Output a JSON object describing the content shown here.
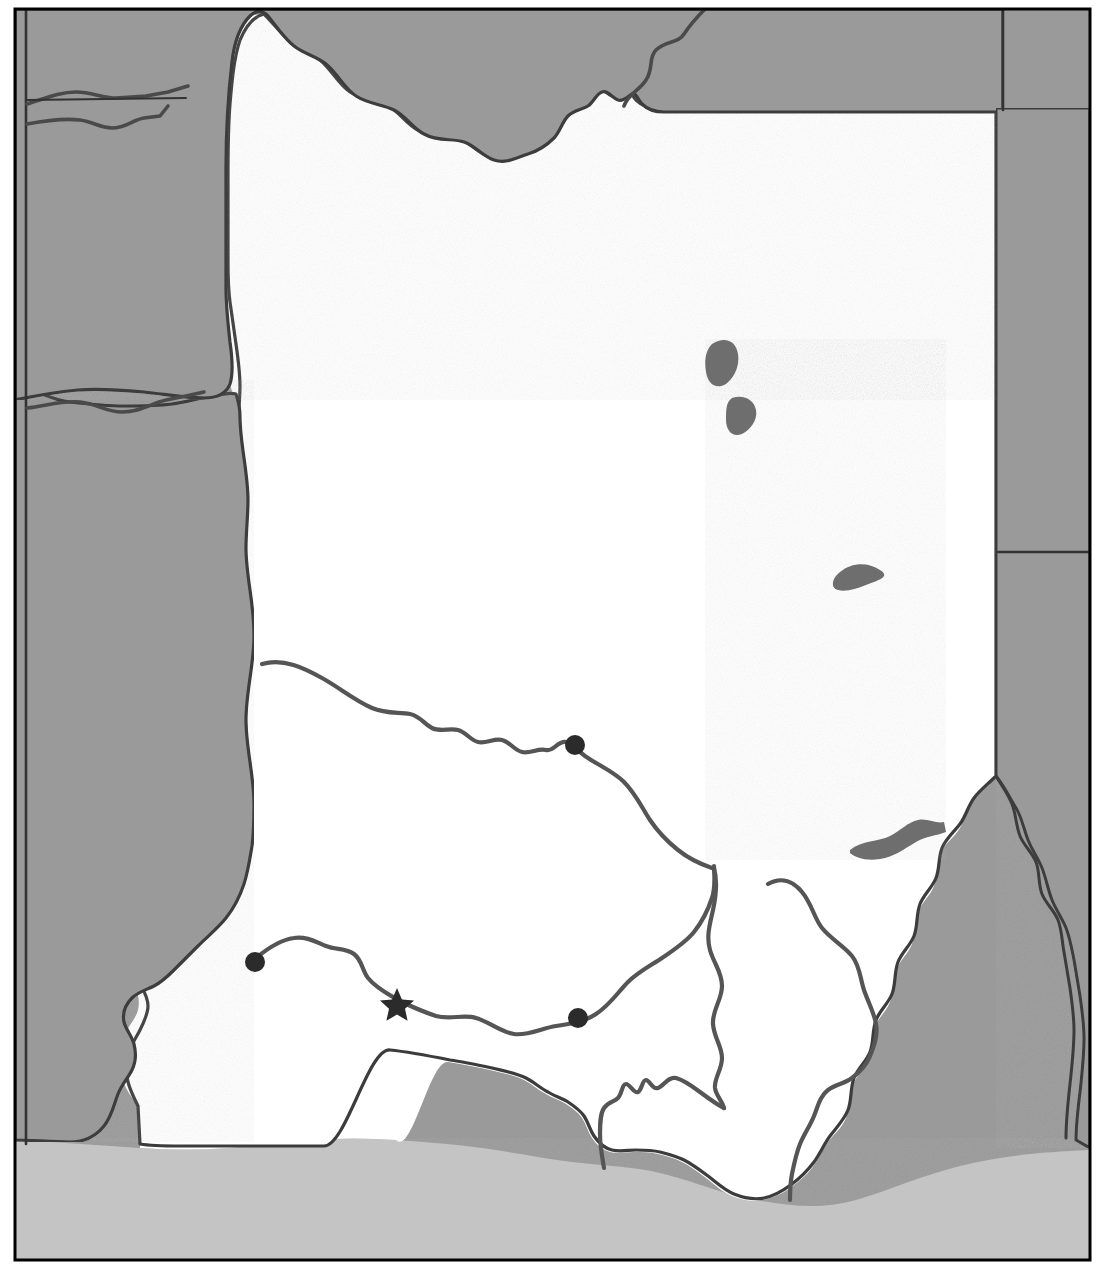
{
  "map": {
    "title": "Regional reference map",
    "kind": "political-physical-outline-map",
    "width": 1099,
    "height": 1269,
    "palette": {
      "background_white": "#ffffff",
      "focus_region_fill": "#ffffff",
      "neighbor_land_fill": "#9a9a9a",
      "water_body_fill": "#c4c4c4",
      "lake_fill": "#6e6e6e",
      "coastline_stroke": "#3c3c3c",
      "internal_boundary_stroke": "#555555",
      "neutral_boundary_stroke": "#333333",
      "frame_stroke": "#000000",
      "marker_fill": "#2b2b2b"
    },
    "frame": {
      "name": "map-neatline",
      "x": 14,
      "y": 8,
      "width": 1077,
      "height": 1253,
      "stroke_width": 3
    },
    "layers": [
      {
        "id": "neighbor-land",
        "label": "Surrounding territory",
        "fill": "#9a9a9a"
      },
      {
        "id": "focus-region",
        "label": "Highlighted region",
        "fill": "#ffffff"
      },
      {
        "id": "water-body",
        "label": "Coastal water",
        "fill": "#c4c4c4"
      },
      {
        "id": "lakes",
        "label": "Inland lakes and reservoirs",
        "fill": "#6e6e6e"
      },
      {
        "id": "district-boundaries",
        "label": "Internal district boundaries",
        "stroke": "#555555"
      },
      {
        "id": "settlements",
        "label": "Settlements",
        "fill": "#2b2b2b"
      }
    ],
    "neighbor_boundaries": [
      {
        "name": "neighbor-boundary-west-vertical",
        "d": "M 26 10 L 26 1150"
      },
      {
        "name": "neighbor-boundary-northwest-1",
        "d": "M 27 100 L 110 100 L 150 98 L 185 94"
      },
      {
        "name": "neighbor-boundary-northwest-2",
        "d": "M 27 406 L 62 404 L 88 400 L 120 404 L 150 400 L 175 396"
      },
      {
        "name": "neighbor-boundary-northeast-vertical",
        "d": "M 1003 8 L 1003 106"
      },
      {
        "name": "neighbor-boundary-east-horizontal",
        "d": "M 996 552 L 1090 552"
      }
    ],
    "rivers": [
      {
        "name": "river-north-tributary",
        "d": "M 625 104 C 628 92 640 88 646 78 C 654 66 648 58 656 50 C 666 40 678 44 684 34 C 692 22 698 16 706 8"
      },
      {
        "name": "river-northwest-inlet",
        "d": "M 27 104 C 45 98 58 92 72 92 C 88 92 98 98 112 98 L 140 96"
      },
      {
        "name": "river-northwest-lower",
        "d": "M 27 122 C 48 118 62 116 78 118 C 92 120 98 126 110 126 C 124 126 130 118 142 116 L 160 114 L 170 106"
      },
      {
        "name": "river-west-mid",
        "d": "M 27 408 C 46 406 60 400 78 402 C 96 404 104 412 120 412 C 138 412 148 404 164 400 L 182 396"
      }
    ],
    "lakes": [
      {
        "name": "lake-north-upper",
        "d": "M 710 342 C 722 336 734 340 736 352 C 738 364 734 376 726 382 C 716 388 708 382 706 372 C 704 360 704 348 710 342 Z"
      },
      {
        "name": "lake-north-lower",
        "d": "M 730 398 C 742 394 752 398 754 408 C 756 418 750 428 742 432 C 732 436 726 430 726 420 C 726 410 724 402 730 398 Z"
      },
      {
        "name": "lake-east-teardrop",
        "d": "M 838 572 C 850 562 866 562 878 568 C 890 574 876 580 866 584 C 856 588 846 592 838 590 C 830 588 830 578 838 572 Z"
      },
      {
        "name": "reservoir-east",
        "d": "M 852 848 C 866 838 884 840 896 834 C 906 830 912 822 922 820 C 934 818 940 824 948 822 L 950 832 C 940 836 930 836 920 842 C 908 848 898 856 884 858 C 870 860 858 858 852 852 Z"
      }
    ],
    "district_boundaries": [
      {
        "name": "district-boundary-north",
        "d": "M 262 664 C 290 660 310 672 330 684 C 352 698 366 712 388 716 C 404 718 414 708 428 712 C 442 716 444 728 458 730 C 472 732 482 720 496 722 C 510 724 516 736 530 738 C 544 740 554 730 566 734 C 578 738 582 748 596 754 C 610 760 622 768 632 780 C 642 792 648 806 654 818 C 660 830 668 842 678 852 C 688 862 700 866 712 868"
      },
      {
        "name": "district-boundary-south",
        "d": "M 258 958 C 272 950 284 940 298 938 C 312 936 320 944 332 948 C 344 952 352 948 362 954 C 372 960 372 972 380 980 C 388 988 398 994 410 998 C 422 1002 434 1010 448 1014 C 462 1018 474 1012 488 1016 C 502 1020 512 1030 526 1032 C 540 1034 552 1026 566 1024 C 580 1022 592 1020 604 1012 C 616 1004 622 992 632 982 C 642 972 654 966 666 958 C 678 950 690 942 698 932 C 706 922 710 910 714 898 C 718 886 716 876 718 866"
      },
      {
        "name": "district-boundary-central-vertical",
        "d": "M 712 868 C 716 882 714 896 712 910 C 710 924 706 936 710 950 C 714 964 722 972 722 986 C 722 1000 714 1010 714 1024 C 714 1038 722 1046 722 1060 C 722 1072 716 1080 716 1090 C 716 1098 722 1102 724 1108"
      },
      {
        "name": "district-boundary-east-arc",
        "d": "M 766 884 C 780 878 792 882 800 890 C 810 900 812 914 820 924 C 830 936 842 942 850 952 C 858 962 858 974 862 986 C 866 998 872 1008 874 1020 C 876 1032 872 1042 870 1054 C 868 1064 864 1070 856 1076 C 848 1082 838 1082 830 1088 C 822 1094 820 1104 816 1114 C 812 1124 806 1132 802 1142 C 798 1152 796 1162 794 1172 C 792 1182 790 1190 788 1198"
      },
      {
        "name": "district-boundary-southwest-spur",
        "d": "M 724 1108 C 716 1106 708 1100 700 1094 C 692 1088 684 1082 676 1080 C 668 1078 664 1086 658 1088 C 652 1090 648 1082 644 1082 C 640 1082 640 1090 636 1092 C 632 1094 628 1086 624 1086 C 620 1086 620 1094 616 1098 C 612 1102 606 1102 602 1108 C 598 1114 598 1124 598 1134 C 598 1146 600 1156 602 1168"
      }
    ],
    "settlements": [
      {
        "name": "settlement-marker-north",
        "type": "circle",
        "cx": 575,
        "cy": 745,
        "r": 10
      },
      {
        "name": "settlement-marker-west",
        "type": "circle",
        "cx": 255,
        "cy": 962,
        "r": 10
      },
      {
        "name": "settlement-marker-southeast",
        "type": "circle",
        "cx": 578,
        "cy": 1018,
        "r": 10
      },
      {
        "name": "capital-marker",
        "type": "star",
        "cx": 397,
        "cy": 1003,
        "r": 14
      }
    ]
  }
}
